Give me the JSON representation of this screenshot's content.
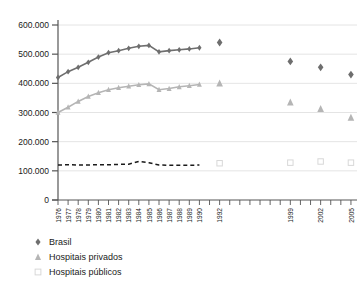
{
  "chart_data": {
    "type": "line",
    "title": "",
    "xlabel": "",
    "ylabel": "",
    "ylim": [
      0,
      600000
    ],
    "yticks": [
      "0",
      "100.000",
      "200.000",
      "300.000",
      "400.000",
      "500.000",
      "600.000"
    ],
    "ytick_values": [
      0,
      100000,
      200000,
      300000,
      400000,
      500000,
      600000
    ],
    "grid": true,
    "legend_position": "below",
    "xticks": [
      "1976",
      "1977",
      "1978",
      "1979",
      "1980",
      "1981",
      "1982",
      "1983",
      "1984",
      "1985",
      "1986",
      "1987",
      "1988",
      "1989",
      "1990",
      "1992",
      "1999",
      "2002",
      "2005"
    ],
    "x_all_years": [
      1976,
      1977,
      1978,
      1979,
      1980,
      1981,
      1982,
      1983,
      1984,
      1985,
      1986,
      1987,
      1988,
      1989,
      1990,
      1991,
      1992,
      1993,
      1994,
      1995,
      1996,
      1997,
      1998,
      1999,
      2000,
      2001,
      2002,
      2003,
      2004,
      2005
    ],
    "series": [
      {
        "name": "Brasil",
        "marker": "diamond",
        "color": "#6e6e6e",
        "x": [
          1976,
          1977,
          1978,
          1979,
          1980,
          1981,
          1982,
          1983,
          1984,
          1985,
          1986,
          1987,
          1988,
          1989,
          1990,
          1992,
          1999,
          2002,
          2005
        ],
        "values": [
          420000,
          440000,
          455000,
          472000,
          490000,
          505000,
          512000,
          520000,
          527000,
          530000,
          508000,
          512000,
          515000,
          518000,
          522000,
          540000,
          475000,
          455000,
          430000
        ],
        "connected_through": 1990
      },
      {
        "name": "Hospitais privados",
        "marker": "triangle",
        "color": "#b5b5b5",
        "x": [
          1976,
          1977,
          1978,
          1979,
          1980,
          1981,
          1982,
          1983,
          1984,
          1985,
          1986,
          1987,
          1988,
          1989,
          1990,
          1992,
          1999,
          2002,
          2005
        ],
        "values": [
          300000,
          318000,
          338000,
          355000,
          368000,
          378000,
          385000,
          390000,
          395000,
          398000,
          378000,
          382000,
          388000,
          392000,
          396000,
          400000,
          335000,
          312000,
          282000
        ],
        "connected_through": 1990
      },
      {
        "name": "Hospitais públicos",
        "marker": "square",
        "color": "#d8d8d8",
        "line_style": "dashed",
        "line_color": "#1a1a1a",
        "x": [
          1976,
          1977,
          1978,
          1979,
          1980,
          1981,
          1982,
          1983,
          1984,
          1985,
          1986,
          1987,
          1988,
          1989,
          1990,
          1992,
          1999,
          2002,
          2005
        ],
        "values": [
          120000,
          121000,
          120000,
          120000,
          121000,
          121000,
          122000,
          123000,
          132000,
          128000,
          120000,
          119000,
          119000,
          119000,
          120000,
          126000,
          128000,
          132000,
          128000
        ],
        "connected_through": 1990
      }
    ]
  },
  "legend": {
    "items": [
      {
        "label": "Brasil",
        "marker": "diamond",
        "color": "#6e6e6e"
      },
      {
        "label": "Hospitais privados",
        "marker": "triangle",
        "color": "#b5b5b5"
      },
      {
        "label": "Hospitais públicos",
        "marker": "square",
        "color": "#d8d8d8"
      }
    ]
  },
  "axis": {
    "y_labels": [
      "600.000",
      "500.000",
      "400.000",
      "300.000",
      "200.000",
      "100.000",
      "0"
    ],
    "x_labels": [
      "1976",
      "1977",
      "1978",
      "1979",
      "1980",
      "1981",
      "1982",
      "1983",
      "1984",
      "1985",
      "1986",
      "1987",
      "1988",
      "1989",
      "1990",
      "1992",
      "1999",
      "2002",
      "2005"
    ]
  }
}
